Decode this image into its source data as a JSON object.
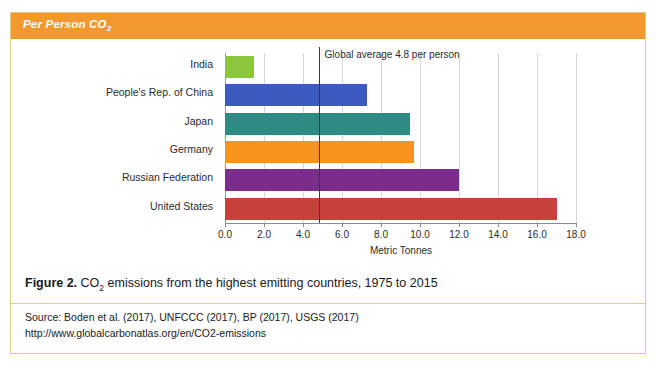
{
  "header": {
    "title_main": "Per Person CO",
    "title_sub": "2"
  },
  "chart_data": {
    "type": "bar",
    "orientation": "horizontal",
    "title": "Per Person CO2",
    "categories": [
      "India",
      "People's Rep. of China",
      "Japan",
      "Germany",
      "Russian Federation",
      "United States"
    ],
    "values": [
      1.5,
      7.3,
      9.5,
      9.7,
      12.0,
      17.0
    ],
    "colors": [
      "#8CC63F",
      "#3B5BC0",
      "#2E8B84",
      "#F7941E",
      "#7B2D8E",
      "#C8403A"
    ],
    "xlabel": "Metric Tonnes",
    "ylabel": "",
    "xlim": [
      0,
      18
    ],
    "xticks": [
      0,
      2,
      4,
      6,
      8,
      10,
      12,
      14,
      16,
      18
    ],
    "xtick_labels": [
      "0.0",
      "2.0",
      "4.0",
      "6.0",
      "8.0",
      "10.0",
      "12.0",
      "14.0",
      "16.0",
      "18.0"
    ],
    "grid": true,
    "legend": "none",
    "annotations": [
      {
        "name": "global-average",
        "text": "Global average 4.8 per person",
        "value": 4.8,
        "type": "vertical-line"
      }
    ]
  },
  "caption": {
    "figure_number": "Figure 2.",
    "text_before_sub": " CO",
    "sub": "2",
    "text_after_sub": " emissions from the highest emitting countries, 1975 to 2015"
  },
  "source": {
    "line1": "Source: Boden et al. (2017), UNFCCC (2017), BP (2017), USGS (2017)",
    "line2": "http://www.globalcarbonatlas.org/en/CO2-emissions"
  },
  "colors": {
    "header_bar": "#f2982f",
    "card_border": "#e8c98e",
    "gridline": "#d7d7d7",
    "axis": "#8a8a8a",
    "average_line": "#3a3a3a"
  }
}
